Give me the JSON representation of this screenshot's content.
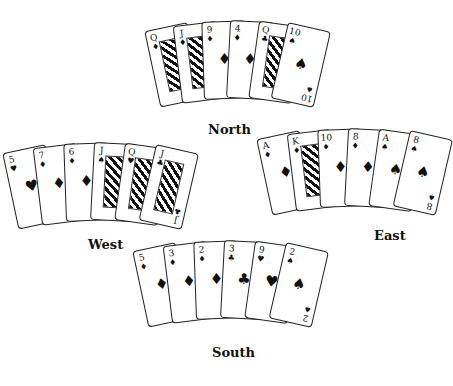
{
  "hands": {
    "north": {
      "label": "North",
      "cards": [
        {
          "rank": "Q",
          "suit": "♦",
          "face": true
        },
        {
          "rank": "J",
          "suit": "♦",
          "face": true
        },
        {
          "rank": "9",
          "suit": "♦"
        },
        {
          "rank": "4",
          "suit": "♦"
        },
        {
          "rank": "Q",
          "suit": "♣",
          "face": true
        },
        {
          "rank": "10",
          "suit": "♠"
        }
      ]
    },
    "west": {
      "label": "West",
      "cards": [
        {
          "rank": "5",
          "suit": "♥"
        },
        {
          "rank": "7",
          "suit": "♦"
        },
        {
          "rank": "6",
          "suit": "♦"
        },
        {
          "rank": "J",
          "suit": "♠",
          "face": true
        },
        {
          "rank": "Q",
          "suit": "♥",
          "face": true
        },
        {
          "rank": "J",
          "suit": "♣",
          "face": true
        }
      ]
    },
    "east": {
      "label": "East",
      "cards": [
        {
          "rank": "A",
          "suit": "♦"
        },
        {
          "rank": "K",
          "suit": "♦",
          "face": true
        },
        {
          "rank": "10",
          "suit": "♦"
        },
        {
          "rank": "8",
          "suit": "♦"
        },
        {
          "rank": "A",
          "suit": "♠"
        },
        {
          "rank": "8",
          "suit": "♠"
        }
      ]
    },
    "south": {
      "label": "South",
      "cards": [
        {
          "rank": "5",
          "suit": "♦"
        },
        {
          "rank": "3",
          "suit": "♦"
        },
        {
          "rank": "2",
          "suit": "♦"
        },
        {
          "rank": "3",
          "suit": "♣"
        },
        {
          "rank": "9",
          "suit": "♥"
        },
        {
          "rank": "2",
          "suit": "♠"
        }
      ]
    }
  }
}
